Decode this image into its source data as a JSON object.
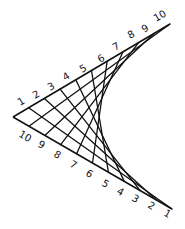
{
  "diagram": {
    "type": "string-art-envelope",
    "color": "#111111",
    "vertex": [
      13,
      117
    ],
    "top_arm_end": [
      170,
      24
    ],
    "bottom_arm_end": [
      172,
      209
    ],
    "top_labels": [
      {
        "text": "1",
        "x": 20,
        "y": 106,
        "rot": -30
      },
      {
        "text": "2",
        "x": 35,
        "y": 99,
        "rot": -30
      },
      {
        "text": "3",
        "x": 50,
        "y": 91,
        "rot": -30
      },
      {
        "text": "4",
        "x": 65,
        "y": 81,
        "rot": -30
      },
      {
        "text": "5",
        "x": 82,
        "y": 73,
        "rot": -30
      },
      {
        "text": "6",
        "x": 100,
        "y": 63,
        "rot": -30
      },
      {
        "text": "7",
        "x": 115,
        "y": 51,
        "rot": -30
      },
      {
        "text": "8",
        "x": 130,
        "y": 39,
        "rot": -30
      },
      {
        "text": "9",
        "x": 144,
        "y": 33,
        "rot": -30
      },
      {
        "text": "10",
        "x": 156,
        "y": 22,
        "rot": -30
      }
    ],
    "bottom_labels": [
      {
        "text": "10",
        "x": 18,
        "y": 136,
        "rot": 30
      },
      {
        "text": "9",
        "x": 37,
        "y": 146,
        "rot": 30
      },
      {
        "text": "8",
        "x": 53,
        "y": 156,
        "rot": 30
      },
      {
        "text": "7",
        "x": 69,
        "y": 166,
        "rot": 30
      },
      {
        "text": "6",
        "x": 85,
        "y": 175,
        "rot": 30
      },
      {
        "text": "5",
        "x": 101,
        "y": 185,
        "rot": 30
      },
      {
        "text": "4",
        "x": 116,
        "y": 193,
        "rot": 30
      },
      {
        "text": "3",
        "x": 131,
        "y": 200,
        "rot": 30
      },
      {
        "text": "2",
        "x": 147,
        "y": 207,
        "rot": 30
      },
      {
        "text": "1",
        "x": 163,
        "y": 215,
        "rot": 30
      }
    ],
    "connections": [
      {
        "from": "top-1",
        "to": "bottom-1"
      },
      {
        "from": "top-2",
        "to": "bottom-2"
      },
      {
        "from": "top-3",
        "to": "bottom-3"
      },
      {
        "from": "top-4",
        "to": "bottom-4"
      },
      {
        "from": "top-5",
        "to": "bottom-5"
      },
      {
        "from": "top-6",
        "to": "bottom-6"
      },
      {
        "from": "top-7",
        "to": "bottom-7"
      },
      {
        "from": "top-8",
        "to": "bottom-8"
      },
      {
        "from": "top-9",
        "to": "bottom-9"
      },
      {
        "from": "top-10",
        "to": "bottom-10"
      }
    ]
  }
}
